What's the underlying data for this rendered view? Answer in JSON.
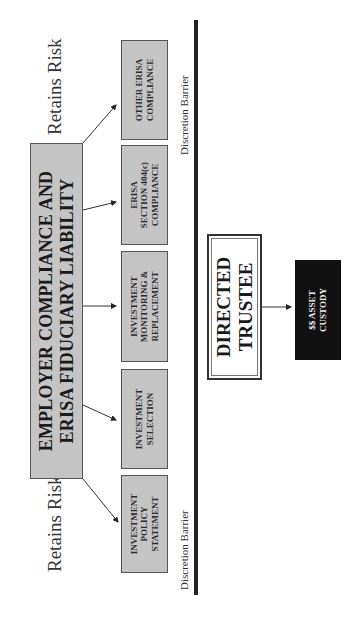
{
  "orientation": "rotated 90 degrees counter-clockwise",
  "main_box": {
    "line1": "EMPLOYER COMPLIANCE AND",
    "line2": "ERISA FIDUCIARY LIABILITY",
    "fill": "#c4c4c4"
  },
  "labels": {
    "retains_risk_left": "Retains Risk",
    "retains_risk_right": "Retains Risk",
    "barrier_left": "Discretion Barrier",
    "barrier_right": "Discretion Barrier"
  },
  "sub_boxes": [
    {
      "lines": [
        "INVESTMENT",
        "POLICY",
        "STATEMENT"
      ]
    },
    {
      "lines": [
        "INVESTMENT",
        "SELECTION"
      ]
    },
    {
      "lines": [
        "INVESTMENT",
        "MONITORING &",
        "REPLACEMENT"
      ]
    },
    {
      "lines": [
        "ERISA",
        "SECTION 404(c)",
        "COMPLIANCE"
      ]
    },
    {
      "lines": [
        "OTHER ERISA",
        "COMPLIANCE"
      ]
    }
  ],
  "trustee_box": {
    "line1": "DIRECTED",
    "line2": "TRUSTEE"
  },
  "custody_box": {
    "line1": "$$ ASSET",
    "line2": "CUSTODY",
    "fill": "#111111"
  },
  "colors": {
    "box_fill": "#c4c4c4",
    "barrier_line": "#222222",
    "custody_fill": "#111111"
  }
}
